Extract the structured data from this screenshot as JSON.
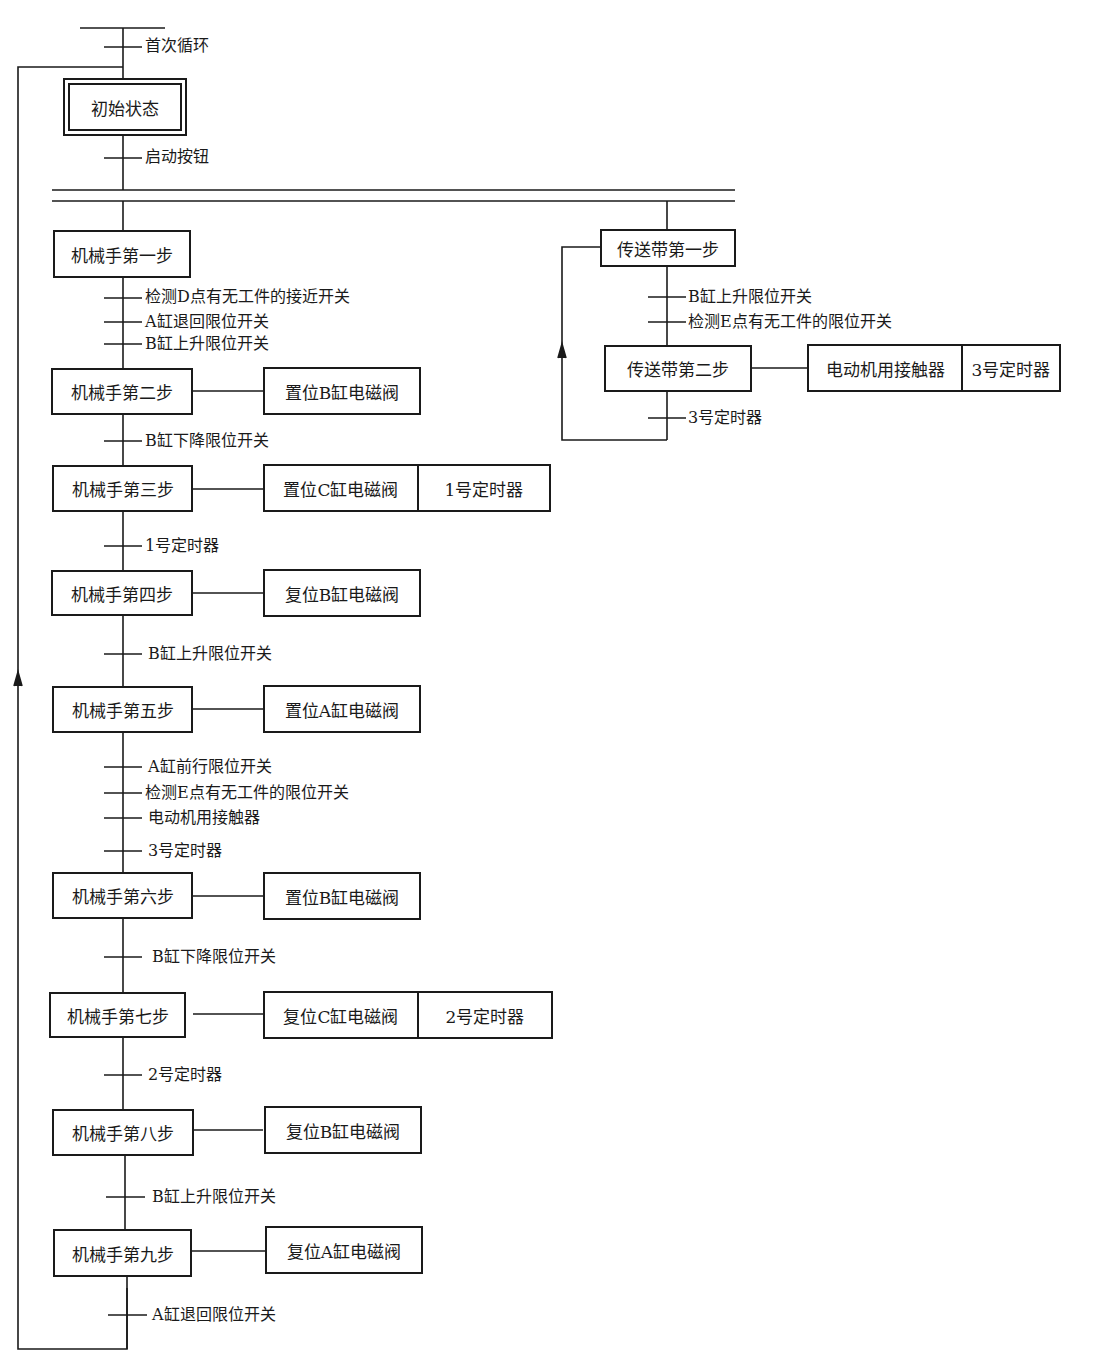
{
  "diagram": {
    "type": "sequential-function-chart",
    "colors": {
      "line": "#1a1a1a",
      "background": "#ffffff"
    },
    "initial_transition": "首次循环",
    "initial_step": "初始状态",
    "start_transition": "启动按钮",
    "manipulator": {
      "steps": [
        {
          "label": "机械手第一步",
          "actions": []
        },
        {
          "label": "机械手第二步",
          "actions": [
            "置位B缸电磁阀"
          ]
        },
        {
          "label": "机械手第三步",
          "actions": [
            "置位C缸电磁阀",
            "1号定时器"
          ]
        },
        {
          "label": "机械手第四步",
          "actions": [
            "复位B缸电磁阀"
          ]
        },
        {
          "label": "机械手第五步",
          "actions": [
            "置位A缸电磁阀"
          ]
        },
        {
          "label": "机械手第六步",
          "actions": [
            "置位B缸电磁阀"
          ]
        },
        {
          "label": "机械手第七步",
          "actions": [
            "复位C缸电磁阀",
            "2号定时器"
          ]
        },
        {
          "label": "机械手第八步",
          "actions": [
            "复位B缸电磁阀"
          ]
        },
        {
          "label": "机械手第九步",
          "actions": [
            "复位A缸电磁阀"
          ]
        }
      ],
      "transitions": [
        [
          "检测D点有无工件的接近开关",
          "A缸退回限位开关",
          "B缸上升限位开关"
        ],
        [
          "B缸下降限位开关"
        ],
        [
          "1号定时器"
        ],
        [
          "B缸上升限位开关"
        ],
        [
          "A缸前行限位开关",
          "检测E点有无工件的限位开关",
          "电动机用接触器",
          "3号定时器"
        ],
        [
          "B缸下降限位开关"
        ],
        [
          "2号定时器"
        ],
        [
          "B缸上升限位开关"
        ],
        [
          "A缸退回限位开关"
        ]
      ]
    },
    "conveyor": {
      "steps": [
        {
          "label": "传送带第一步",
          "actions": []
        },
        {
          "label": "传送带第二步",
          "actions": [
            "电动机用接触器",
            "3号定时器"
          ]
        }
      ],
      "transitions": [
        [
          "B缸上升限位开关",
          "检测E点有无工件的限位开关"
        ],
        [
          "3号定时器"
        ]
      ]
    }
  }
}
